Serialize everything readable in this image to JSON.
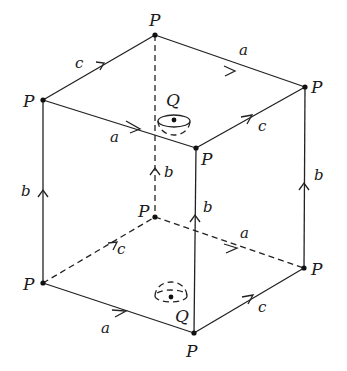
{
  "diagram": {
    "type": "cube with identified faces (3-torus)",
    "vertex_label": "P",
    "center_label": "Q",
    "edge_labels": {
      "a": "a",
      "b": "b",
      "c": "c"
    },
    "vertices": {
      "top_back": {
        "label": "P"
      },
      "top_left": {
        "label": "P"
      },
      "top_right": {
        "label": "P"
      },
      "top_front": {
        "label": "P"
      },
      "bottom_back": {
        "label": "P"
      },
      "bottom_left": {
        "label": "P"
      },
      "bottom_right": {
        "label": "P"
      },
      "bottom_front": {
        "label": "P"
      }
    },
    "points": {
      "q_top": {
        "label": "Q"
      },
      "q_bottom": {
        "label": "Q"
      }
    },
    "edges": [
      {
        "id": "top-left-back",
        "label": "c",
        "style": "solid"
      },
      {
        "id": "top-back-right",
        "label": "a",
        "style": "solid"
      },
      {
        "id": "top-left-front",
        "label": "a",
        "style": "solid"
      },
      {
        "id": "top-front-right",
        "label": "c",
        "style": "solid"
      },
      {
        "id": "vert-left",
        "label": "b",
        "style": "solid"
      },
      {
        "id": "vert-back",
        "label": "b",
        "style": "dashed"
      },
      {
        "id": "vert-front",
        "label": "b",
        "style": "solid"
      },
      {
        "id": "vert-right",
        "label": "b",
        "style": "solid"
      },
      {
        "id": "bot-left-back",
        "label": "c",
        "style": "dashed"
      },
      {
        "id": "bot-back-right",
        "label": "a",
        "style": "dashed"
      },
      {
        "id": "bot-left-front",
        "label": "a",
        "style": "solid"
      },
      {
        "id": "bot-front-right",
        "label": "c",
        "style": "solid"
      }
    ]
  }
}
